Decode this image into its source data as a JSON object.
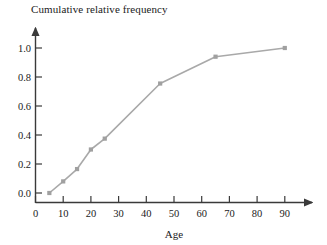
{
  "chart_data": {
    "type": "line",
    "title": "Cumulative relative frequency",
    "xlabel": "Age",
    "ylabel": "",
    "x": [
      5,
      10,
      15,
      20,
      25,
      45,
      65,
      90
    ],
    "values": [
      0.0,
      0.08,
      0.165,
      0.3,
      0.375,
      0.755,
      0.94,
      1.0
    ],
    "series": [
      {
        "name": "Cumulative relative frequency",
        "values": [
          0.0,
          0.08,
          0.165,
          0.3,
          0.375,
          0.755,
          0.94,
          1.0
        ]
      }
    ],
    "xlim": [
      0,
      95
    ],
    "ylim": [
      0.0,
      1.08
    ],
    "xticks": [
      0,
      10,
      20,
      30,
      40,
      50,
      60,
      70,
      80,
      90
    ],
    "xtick_labels": [
      "0",
      "10",
      "20",
      "30",
      "40",
      "50",
      "60",
      "70",
      "80",
      "90"
    ],
    "yticks": [
      0.0,
      0.2,
      0.4,
      0.6,
      0.8,
      1.0
    ],
    "ytick_labels": [
      "0.0",
      "0.2",
      "0.4",
      "0.6",
      "0.8",
      "1.0"
    ],
    "grid": false,
    "legend": "none",
    "marker": "square",
    "line_color": "#a9a9a9",
    "marker_color": "#a0a0a0",
    "axis_color": "#3a3a3a"
  }
}
